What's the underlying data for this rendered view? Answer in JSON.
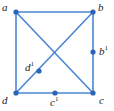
{
  "figure": {
    "kind": "graph-diagram",
    "width": 114,
    "height": 111,
    "background_color": "#ffffff",
    "edge_color": "#4a86d4",
    "vertex_color": "#2b63b8",
    "label_color": "#232323",
    "edge_width": 1.6,
    "vertex_radius": 2.6
  },
  "labels": {
    "a": "a",
    "b": "b",
    "b1_base": "b",
    "b1_sup": "1",
    "c": "c",
    "c1_base": "c",
    "c1_sup": "1",
    "d": "d",
    "d1_base": "d",
    "d1_sup": "1"
  },
  "chart_data": {
    "type": "diagram",
    "title": "",
    "subtitle": "",
    "xlabel": "",
    "ylabel": "",
    "grid": false,
    "legend": "none",
    "nodes": [
      {
        "id": "a",
        "label": "a",
        "sup": "",
        "x": 16,
        "y": 12,
        "label_pos": "top-left"
      },
      {
        "id": "b",
        "label": "b",
        "sup": "",
        "x": 93,
        "y": 12,
        "label_pos": "top-right"
      },
      {
        "id": "b1",
        "label": "b",
        "sup": "1",
        "x": 93,
        "y": 52,
        "label_pos": "right"
      },
      {
        "id": "d1",
        "label": "d",
        "sup": "1",
        "x": 39,
        "y": 71,
        "label_pos": "left"
      },
      {
        "id": "d",
        "label": "d",
        "sup": "",
        "x": 16,
        "y": 93,
        "label_pos": "bottom-left"
      },
      {
        "id": "c1",
        "label": "c",
        "sup": "1",
        "x": 55,
        "y": 93,
        "label_pos": "bottom"
      },
      {
        "id": "c",
        "label": "c",
        "sup": "",
        "x": 93,
        "y": 93,
        "label_pos": "bottom-right"
      }
    ],
    "edges": [
      {
        "from": "a",
        "to": "b",
        "name": "top-edge"
      },
      {
        "from": "b",
        "to": "c",
        "name": "right-edge"
      },
      {
        "from": "d",
        "to": "c",
        "name": "bottom-edge"
      },
      {
        "from": "a",
        "to": "d",
        "name": "left-edge"
      },
      {
        "from": "a",
        "to": "c",
        "name": "diagonal-a-c"
      },
      {
        "from": "d",
        "to": "b",
        "name": "diagonal-d-b"
      }
    ],
    "crossing_point": {
      "x": 55,
      "y": 53
    }
  }
}
